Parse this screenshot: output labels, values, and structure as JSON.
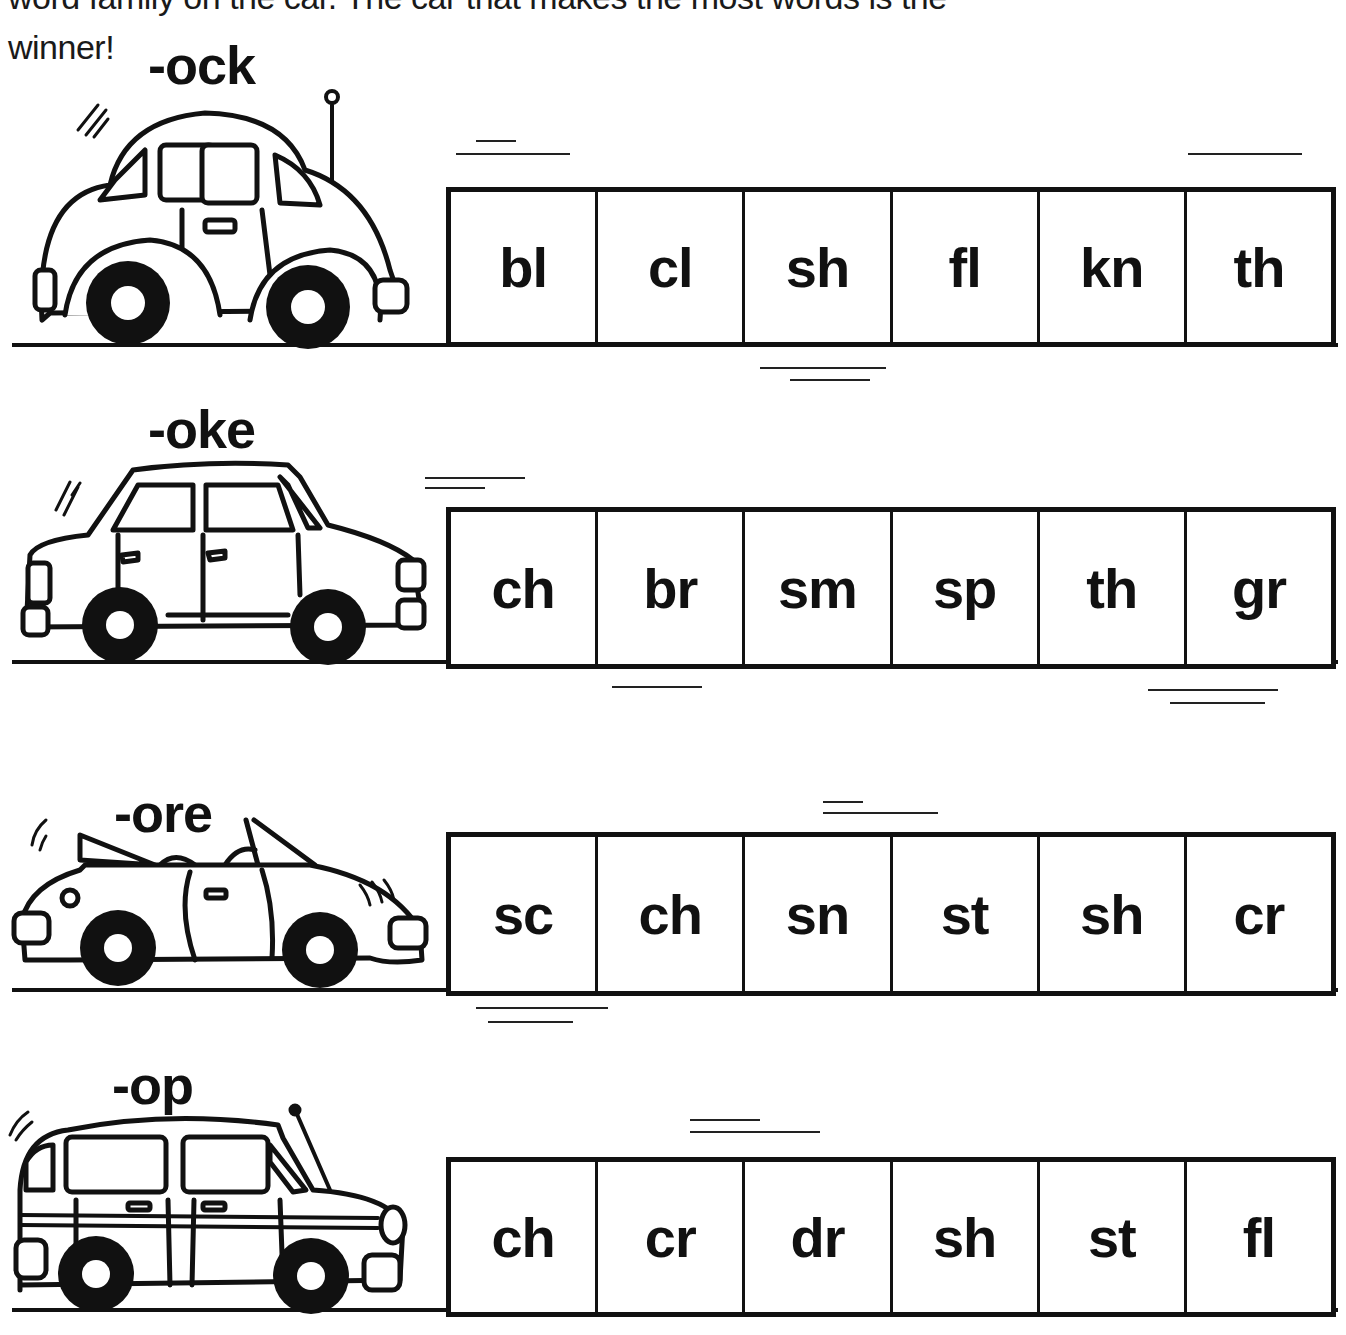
{
  "instructions": {
    "line1": "word family on the car. The car that makes the most words is the",
    "line2": "winner!"
  },
  "rows": [
    {
      "family": "-ock",
      "car": "beetle-car",
      "onsets": [
        "bl",
        "cl",
        "sh",
        "fl",
        "kn",
        "th"
      ]
    },
    {
      "family": "-oke",
      "car": "sedan-car",
      "onsets": [
        "ch",
        "br",
        "sm",
        "sp",
        "th",
        "gr"
      ]
    },
    {
      "family": "-ore",
      "car": "convertible-car",
      "onsets": [
        "sc",
        "ch",
        "sn",
        "st",
        "sh",
        "cr"
      ]
    },
    {
      "family": "-op",
      "car": "wagon-car",
      "onsets": [
        "ch",
        "cr",
        "dr",
        "sh",
        "st",
        "fl"
      ]
    }
  ],
  "colors": {
    "ink": "#111111",
    "paper": "#ffffff"
  }
}
